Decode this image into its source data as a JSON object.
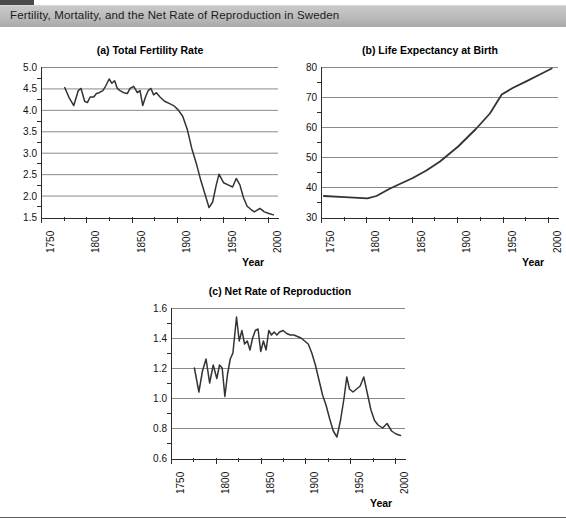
{
  "banner": {
    "title": "Fertility, Mortality, and the Net Rate of Reproduction in Sweden"
  },
  "axis_label": "Year",
  "panels": [
    {
      "id": "a",
      "title": "(a) Total Fertility Rate"
    },
    {
      "id": "b",
      "title": "(b) Life Expectancy at Birth"
    },
    {
      "id": "c",
      "title": "(c) Net Rate of Reproduction"
    }
  ],
  "chart_data": [
    {
      "type": "line",
      "title": "(a) Total Fertility Rate",
      "xlabel": "Year",
      "ylabel": "",
      "xlim": [
        1750,
        2010
      ],
      "ylim": [
        1.5,
        5.0
      ],
      "xticks": [
        1750,
        1800,
        1850,
        1900,
        1950,
        2000
      ],
      "xtick_labels": [
        "1750",
        "1800",
        "1850",
        "1900",
        "1950",
        "2000"
      ],
      "yticks": [
        1.5,
        2.0,
        2.5,
        3.0,
        3.5,
        4.0,
        4.5,
        5.0
      ],
      "ytick_labels": [
        "1.5",
        "2.0",
        "2.5",
        "3.0",
        "3.5",
        "4.0",
        "4.5",
        "5.0"
      ],
      "grid": "horizontal",
      "legend": "none",
      "x": [
        1775,
        1780,
        1785,
        1790,
        1793,
        1797,
        1800,
        1803,
        1807,
        1810,
        1813,
        1817,
        1820,
        1824,
        1827,
        1830,
        1833,
        1836,
        1840,
        1844,
        1847,
        1851,
        1855,
        1858,
        1861,
        1864,
        1867,
        1870,
        1873,
        1876,
        1880,
        1885,
        1890,
        1895,
        1900,
        1905,
        1910,
        1915,
        1920,
        1925,
        1930,
        1934,
        1938,
        1942,
        1945,
        1950,
        1955,
        1960,
        1964,
        1968,
        1972,
        1976,
        1980,
        1984,
        1990,
        1995,
        2000,
        2005
      ],
      "y": [
        4.52,
        4.28,
        4.1,
        4.45,
        4.5,
        4.2,
        4.17,
        4.3,
        4.3,
        4.38,
        4.4,
        4.45,
        4.55,
        4.72,
        4.62,
        4.68,
        4.5,
        4.45,
        4.4,
        4.38,
        4.5,
        4.55,
        4.4,
        4.45,
        4.1,
        4.3,
        4.45,
        4.5,
        4.35,
        4.4,
        4.3,
        4.2,
        4.15,
        4.1,
        4.0,
        3.85,
        3.55,
        3.1,
        2.75,
        2.35,
        2.0,
        1.72,
        1.85,
        2.25,
        2.5,
        2.3,
        2.25,
        2.2,
        2.4,
        2.25,
        1.95,
        1.75,
        1.68,
        1.62,
        1.7,
        1.62,
        1.58,
        1.55
      ]
    },
    {
      "type": "line",
      "title": "(b) Life Expectancy at Birth",
      "xlabel": "Year",
      "ylabel": "",
      "xlim": [
        1750,
        2010
      ],
      "ylim": [
        30,
        80
      ],
      "xticks": [
        1750,
        1800,
        1850,
        1900,
        1950,
        2000
      ],
      "xtick_labels": [
        "1750",
        "1800",
        "1850",
        "1900",
        "1950",
        "2000"
      ],
      "yticks": [
        30,
        40,
        50,
        60,
        70,
        80
      ],
      "ytick_labels": [
        "30",
        "40",
        "50",
        "60",
        "70",
        "80"
      ],
      "grid": "horizontal",
      "legend": "none",
      "x": [
        1752,
        1775,
        1800,
        1810,
        1825,
        1850,
        1865,
        1880,
        1900,
        1920,
        1935,
        1948,
        1960,
        1975,
        1990,
        2003
      ],
      "y": [
        37.0,
        36.6,
        36.2,
        37.0,
        39.5,
        43.0,
        45.5,
        48.5,
        53.5,
        59.5,
        64.5,
        70.8,
        73.0,
        75.2,
        77.5,
        79.5
      ]
    },
    {
      "type": "line",
      "title": "(c) Net Rate of Reproduction",
      "xlabel": "Year",
      "ylabel": "",
      "xlim": [
        1750,
        2010
      ],
      "ylim": [
        0.6,
        1.6
      ],
      "xticks": [
        1750,
        1800,
        1850,
        1900,
        1950,
        2000
      ],
      "xtick_labels": [
        "1750",
        "1800",
        "1850",
        "1900",
        "1950",
        "2000"
      ],
      "yticks": [
        0.6,
        0.8,
        1.0,
        1.2,
        1.4,
        1.6
      ],
      "ytick_labels": [
        "0.6",
        "0.8",
        "1.0",
        "1.2",
        "1.4",
        "1.6"
      ],
      "grid": "horizontal",
      "legend": "none",
      "x": [
        1775,
        1780,
        1784,
        1788,
        1792,
        1796,
        1800,
        1803,
        1806,
        1809,
        1812,
        1815,
        1818,
        1822,
        1825,
        1828,
        1831,
        1834,
        1837,
        1840,
        1843,
        1846,
        1849,
        1852,
        1855,
        1858,
        1861,
        1864,
        1867,
        1870,
        1874,
        1878,
        1882,
        1886,
        1890,
        1894,
        1898,
        1902,
        1906,
        1910,
        1914,
        1918,
        1922,
        1926,
        1930,
        1934,
        1938,
        1942,
        1945,
        1948,
        1952,
        1956,
        1960,
        1964,
        1968,
        1972,
        1976,
        1980,
        1985,
        1990,
        1995,
        2000,
        2005
      ],
      "y": [
        1.2,
        1.04,
        1.18,
        1.26,
        1.1,
        1.22,
        1.13,
        1.22,
        1.2,
        1.01,
        1.16,
        1.26,
        1.3,
        1.54,
        1.38,
        1.45,
        1.36,
        1.38,
        1.32,
        1.4,
        1.45,
        1.46,
        1.31,
        1.38,
        1.32,
        1.45,
        1.42,
        1.44,
        1.42,
        1.44,
        1.45,
        1.43,
        1.42,
        1.42,
        1.41,
        1.4,
        1.38,
        1.36,
        1.3,
        1.22,
        1.12,
        1.02,
        0.95,
        0.86,
        0.78,
        0.74,
        0.85,
        1.0,
        1.14,
        1.06,
        1.04,
        1.06,
        1.08,
        1.14,
        1.03,
        0.92,
        0.85,
        0.82,
        0.8,
        0.83,
        0.78,
        0.76,
        0.75
      ]
    }
  ]
}
